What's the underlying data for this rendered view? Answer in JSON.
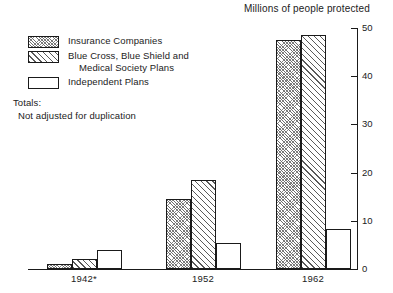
{
  "chart_data": {
    "type": "bar",
    "title": "Millions of people protected",
    "xlabel": "",
    "ylabel": "Millions of people protected",
    "ylim": [
      0,
      50
    ],
    "yticks": [
      0,
      10,
      20,
      30,
      40,
      50
    ],
    "ytick_labels": [
      "0",
      "10",
      "20",
      "30",
      "40",
      "50"
    ],
    "grid": false,
    "legend_position": "upper-left",
    "axis_position": "right",
    "categories": [
      "1942*",
      "1952",
      "1962"
    ],
    "series": [
      {
        "name": "Insurance Companies",
        "pattern": "dense-crosshatch",
        "values": [
          1.0,
          14.5,
          47.5
        ]
      },
      {
        "name": "Blue Cross, Blue Shield and Medical Society Plans",
        "pattern": "diagonal-hatch",
        "values": [
          2.0,
          18.5,
          48.5
        ]
      },
      {
        "name": "Independent Plans",
        "pattern": "open",
        "values": [
          4.0,
          5.5,
          8.3
        ]
      }
    ],
    "annotations": [
      "Totals:",
      "Not adjusted for duplication"
    ]
  },
  "legend": {
    "items": [
      {
        "label": "Insurance Companies",
        "label_line2": ""
      },
      {
        "label": "Blue Cross, Blue Shield and",
        "label_line2": "Medical Society Plans"
      },
      {
        "label": "Independent Plans",
        "label_line2": ""
      }
    ]
  },
  "notes": {
    "totals_heading": "Totals:",
    "totals_text": "Not adjusted for duplication"
  },
  "colors": {
    "ink": "#1a1a1a",
    "paper": "#ffffff",
    "hatch": "#5a5a5a"
  }
}
